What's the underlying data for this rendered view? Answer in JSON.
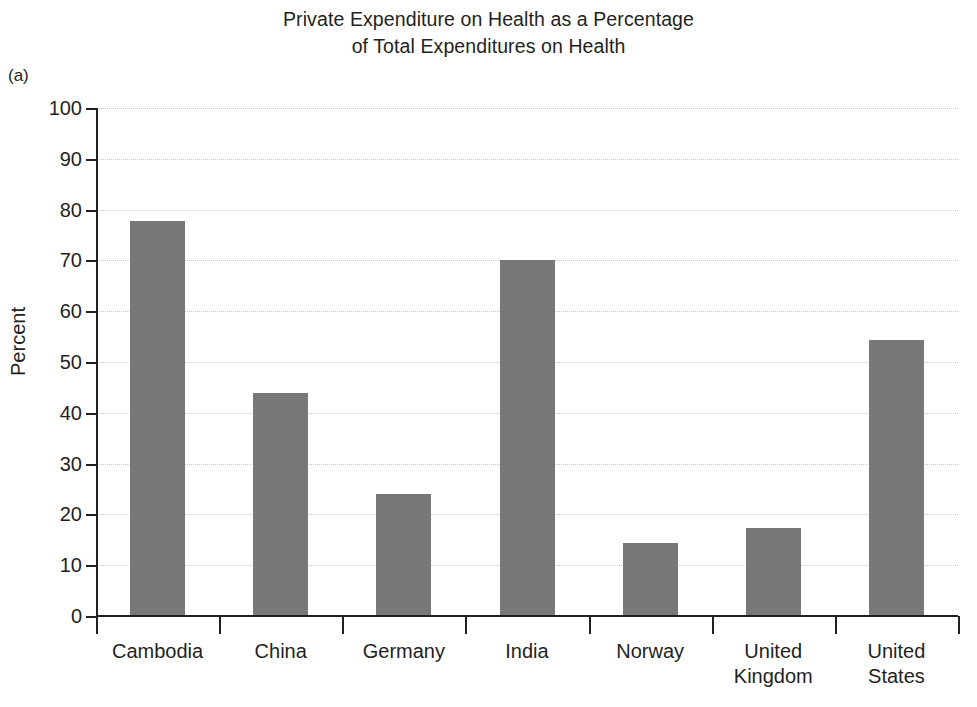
{
  "panel_label": "(a)",
  "title_lines": [
    "Private Expenditure on Health as a Percentage",
    "of Total Expenditures on Health"
  ],
  "colors": {
    "bar_fill": "#787878",
    "axis": "#231f20",
    "gridline": "#c9c9c9",
    "background": "#ffffff",
    "text": "#231f20"
  },
  "chart_data": {
    "type": "bar",
    "title": "Private Expenditure on Health as a Percentage of Total Expenditures on Health",
    "xlabel": "",
    "ylabel": "Percent",
    "ylim": [
      0,
      100
    ],
    "ytick_step": 10,
    "yticks": [
      0,
      10,
      20,
      30,
      40,
      50,
      60,
      70,
      80,
      90,
      100
    ],
    "ytick_labels": [
      "0",
      "10",
      "20",
      "30",
      "40",
      "50",
      "60",
      "70",
      "80",
      "90",
      "100"
    ],
    "grid": true,
    "grid_axis": "y",
    "grid_style": "dotted",
    "legend": false,
    "categories": [
      "Cambodia",
      "China",
      "Germany",
      "India",
      "Norway",
      "United Kingdom",
      "United States"
    ],
    "category_labels": [
      [
        "Cambodia"
      ],
      [
        "China"
      ],
      [
        "Germany"
      ],
      [
        "India"
      ],
      [
        "Norway"
      ],
      [
        "United",
        "Kingdom"
      ],
      [
        "United",
        "States"
      ]
    ],
    "values": [
      77.7,
      43.9,
      24.1,
      70.0,
      14.3,
      17.3,
      54.3
    ]
  }
}
